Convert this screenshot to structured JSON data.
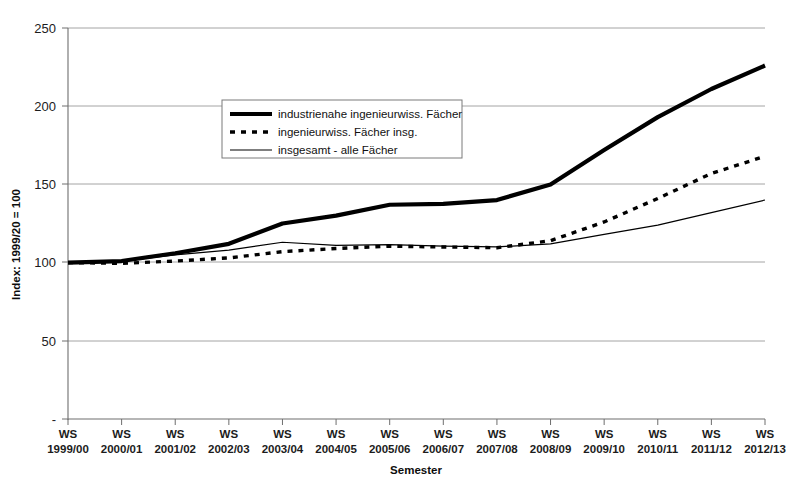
{
  "chart_data": {
    "type": "line",
    "title": "",
    "xlabel": "Semester",
    "ylabel": "Index: 1999/20 = 100",
    "ylim": [
      0,
      250
    ],
    "yticks": [
      "-",
      "50",
      "100",
      "150",
      "200",
      "250"
    ],
    "ytick_values": [
      0,
      50,
      100,
      150,
      200,
      250
    ],
    "grid": true,
    "legend_position": "upper-left-inside",
    "categories": [
      "WS\n1999/00",
      "WS\n2000/01",
      "WS\n2001/02",
      "WS\n2002/03",
      "WS\n2003/04",
      "WS\n2004/05",
      "WS\n2005/06",
      "WS\n2006/07",
      "WS\n2007/08",
      "WS\n2008/09",
      "WS\n2009/10",
      "WS\n2010/11",
      "WS\n2011/12",
      "WS\n2012/13"
    ],
    "category_lines": [
      [
        "WS",
        "1999/00"
      ],
      [
        "WS",
        "2000/01"
      ],
      [
        "WS",
        "2001/02"
      ],
      [
        "WS",
        "2002/03"
      ],
      [
        "WS",
        "2003/04"
      ],
      [
        "WS",
        "2004/05"
      ],
      [
        "WS",
        "2005/06"
      ],
      [
        "WS",
        "2006/07"
      ],
      [
        "WS",
        "2007/08"
      ],
      [
        "WS",
        "2008/09"
      ],
      [
        "WS",
        "2009/10"
      ],
      [
        "WS",
        "2010/11"
      ],
      [
        "WS",
        "2011/12"
      ],
      [
        "WS",
        "2012/13"
      ]
    ],
    "series": [
      {
        "name": "industrienahe ingenieurwiss. Fächer",
        "style": "thick-solid",
        "color": "#000000",
        "width": 4.2,
        "values": [
          100,
          101,
          106,
          112,
          125,
          130,
          137,
          137.5,
          140,
          150,
          172,
          193,
          211,
          226
        ]
      },
      {
        "name": "ingenieurwiss. Fächer insg.",
        "style": "dashed",
        "color": "#000000",
        "width": 3.4,
        "dash": "5,4",
        "values": [
          100,
          99.5,
          101,
          103,
          107,
          109,
          110.5,
          110,
          109.5,
          114,
          126,
          141,
          157,
          168
        ]
      },
      {
        "name": "insgesamt - alle Fächer",
        "style": "thin-solid",
        "color": "#000000",
        "width": 1.2,
        "values": [
          100,
          101,
          105,
          108,
          113,
          111,
          111.5,
          110.5,
          110,
          112,
          118,
          124,
          132,
          140
        ]
      }
    ]
  },
  "legend": {
    "entries": [
      {
        "label": "industrienahe ingenieurwiss. Fächer",
        "swatch": "thick-solid-swatch"
      },
      {
        "label": "ingenieurwiss. Fächer insg.",
        "swatch": "dashed-swatch"
      },
      {
        "label": "insgesamt - alle Fächer",
        "swatch": "thin-solid-swatch"
      }
    ]
  },
  "axes": {
    "y_title": "Index: 1999/20 = 100",
    "x_title": "Semester"
  }
}
